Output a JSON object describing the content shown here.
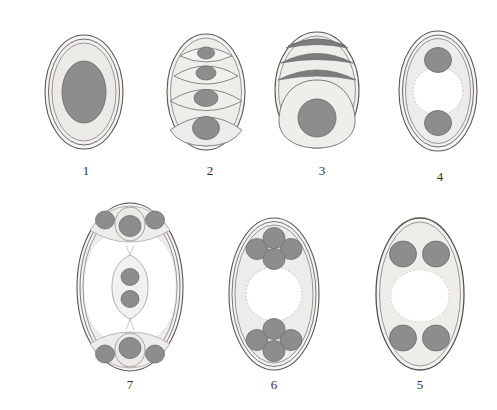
{
  "plate": {
    "title": "",
    "background_color": "#ffffff",
    "figure_count": 7,
    "rows": [
      {
        "name": "top-row",
        "labels": [
          "1",
          "2",
          "3",
          "4"
        ]
      },
      {
        "name": "bottom-row",
        "labels": [
          "7",
          "6",
          "5"
        ]
      }
    ]
  },
  "palette": {
    "outline": "#4a4845",
    "outline_light": "#8e8b86",
    "cytoplasm": "#f0efed",
    "cytoplasm_shade": "#e7e6e3",
    "nucleus": "#8d8d8d",
    "nucleus_outline": "#6e6e6e",
    "band_dark": "#7c7c7c",
    "void_white": "#ffffff",
    "dotted": "#b9b7b3",
    "label_text": "#33322f"
  },
  "figures": [
    {
      "id": "figure-1",
      "label": "1",
      "label_x": 84,
      "label_y": 168,
      "description": "single oval cell with double membrane and one large central nucleus",
      "nuclei": 1,
      "membrane_rings": 3,
      "has_central_void": false
    },
    {
      "id": "figure-2",
      "label": "2",
      "label_x": 208,
      "label_y": 168,
      "description": "oval with four stacked lens-shaped cells, each containing a nucleus, increasing in size top to bottom",
      "cells": 4,
      "nuclei": 4,
      "membrane_rings": 2,
      "has_central_void": false
    },
    {
      "id": "figure-3",
      "label": "3",
      "label_x": 320,
      "label_y": 168,
      "description": "oval with three dark curved bands at top and one large pear-shaped cell with nucleus below",
      "bands": 3,
      "cells": 1,
      "nuclei": 1,
      "membrane_rings": 2,
      "has_central_void": false
    },
    {
      "id": "figure-4",
      "label": "4",
      "label_x": 438,
      "label_y": 172,
      "description": "oval with central white void and one nucleus above, one nucleus below",
      "nuclei": 2,
      "membrane_rings": 3,
      "has_central_void": true
    },
    {
      "id": "figure-7",
      "label": "7",
      "label_x": 128,
      "label_y": 385,
      "description": "oval with white void, polar cell clusters of three nuclei at top and bottom, and a central spindle cell with two nuclei",
      "polar_clusters": 2,
      "nuclei_per_cluster": 3,
      "central_spindle_nuclei": 2,
      "nuclei": 8,
      "membrane_rings": 3,
      "has_central_void": true
    },
    {
      "id": "figure-6",
      "label": "6",
      "label_x": 272,
      "label_y": 385,
      "description": "oval with central dotted white void and two diamond clusters of four nuclei each",
      "clusters": 2,
      "nuclei_per_cluster": 4,
      "nuclei": 8,
      "membrane_rings": 3,
      "has_central_void": true
    },
    {
      "id": "figure-5",
      "label": "5",
      "label_x": 418,
      "label_y": 385,
      "description": "oval with central white void and a pair of nuclei at top and a pair at bottom",
      "clusters": 2,
      "nuclei_per_cluster": 2,
      "nuclei": 4,
      "membrane_rings": 2,
      "has_central_void": true
    }
  ]
}
